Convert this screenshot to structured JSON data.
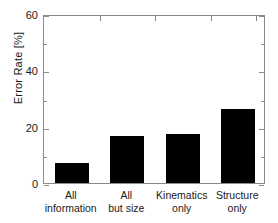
{
  "chart_data": {
    "type": "bar",
    "title": "",
    "xlabel": "",
    "ylabel": "Error Rate [%]",
    "categories": [
      "All\ninformation",
      "All\nbut size",
      "Kinematics\nonly",
      "Structure\nonly"
    ],
    "category_labels_flat": [
      "All information",
      "All but size",
      "Kinematics only",
      "Structure only"
    ],
    "values": [
      7.1,
      16.7,
      17.5,
      26.2
    ],
    "ylim": [
      0,
      60
    ],
    "yticks": [
      0,
      20,
      40,
      60
    ],
    "ytick_labels": [
      "0",
      "20",
      "40",
      "60"
    ],
    "yminor_ticks": [
      10,
      30,
      50
    ],
    "grid": false,
    "legend": null,
    "bar_color": "#000000",
    "axis_color": "#8a8a8a",
    "text_color": "#1a1a1a",
    "background": "#ffffff"
  }
}
